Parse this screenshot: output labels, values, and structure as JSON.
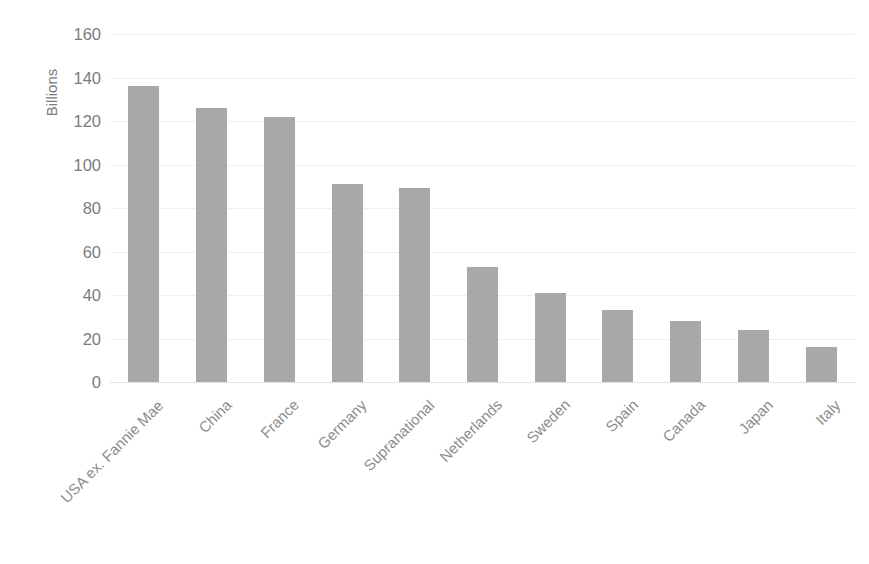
{
  "chart_data": {
    "type": "bar",
    "title": "",
    "subtitle": "",
    "xlabel": "",
    "ylabel": "Billions",
    "ylim": [
      0,
      160
    ],
    "ytick_step": 20,
    "ytick_labels": [
      "160",
      "140",
      "120",
      "100",
      "80",
      "60",
      "40",
      "20",
      "0"
    ],
    "grid": true,
    "legend": null,
    "bar_color": "#a8a8a8",
    "gridline_color": "#efefef",
    "axis_text_color": "#7c7c7c",
    "label_rotation_degrees": -45,
    "categories": [
      "USA ex. Fannie Mae",
      "China",
      "France",
      "Germany",
      "Supranational",
      "Netherlands",
      "Sweden",
      "Spain",
      "Canada",
      "Japan",
      "Italy"
    ],
    "values": [
      136,
      126,
      122,
      91,
      89,
      53,
      41,
      33,
      28,
      24,
      16
    ]
  }
}
